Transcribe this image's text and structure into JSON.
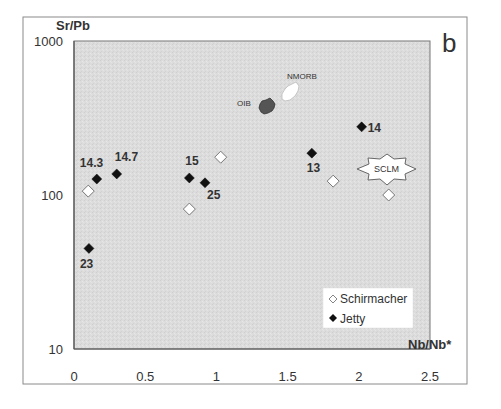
{
  "panel_label": "b",
  "chart_data": {
    "type": "scatter",
    "title": "",
    "xlabel": "Nb/Nb*",
    "ylabel": "Sr/Pb",
    "xscale": "linear",
    "yscale": "log",
    "xlim": [
      0,
      2.5
    ],
    "ylim": [
      10,
      1000
    ],
    "xticks": [
      0,
      0.5,
      1,
      1.5,
      2,
      2.5
    ],
    "xtick_labels": [
      "0",
      "0.5",
      "1",
      "1.5",
      "2",
      "2.5"
    ],
    "yticks": [
      10,
      100,
      1000
    ],
    "ytick_labels": [
      "10",
      "100",
      "1000"
    ],
    "grid": false,
    "legend_position": "lower right",
    "series": [
      {
        "name": "Schirmacher",
        "marker": "open-diamond",
        "color": "#ffffff",
        "points": [
          {
            "x": 0.1,
            "y": 106,
            "label": ""
          },
          {
            "x": 0.81,
            "y": 81,
            "label": ""
          },
          {
            "x": 1.03,
            "y": 176,
            "label": ""
          },
          {
            "x": 1.82,
            "y": 123,
            "label": ""
          },
          {
            "x": 2.21,
            "y": 100,
            "label": ""
          }
        ]
      },
      {
        "name": "Jetty",
        "marker": "filled-diamond",
        "color": "#111111",
        "points": [
          {
            "x": 0.16,
            "y": 127,
            "label": "14.3"
          },
          {
            "x": 0.3,
            "y": 137,
            "label": "14.7"
          },
          {
            "x": 0.81,
            "y": 129,
            "label": "15"
          },
          {
            "x": 0.92,
            "y": 120,
            "label": "25"
          },
          {
            "x": 0.105,
            "y": 45,
            "label": "23"
          },
          {
            "x": 1.67,
            "y": 187,
            "label": "13"
          },
          {
            "x": 2.02,
            "y": 277,
            "label": "14"
          }
        ]
      }
    ],
    "annotations": [
      {
        "text": "OIB",
        "x": 1.32,
        "y": 350,
        "shape": "dark-grey-star"
      },
      {
        "text": "NMORB",
        "x": 1.5,
        "y": 420,
        "shape": "white-star"
      },
      {
        "text": "SCLM",
        "x": 2.1,
        "y": 125,
        "shape": "white-star-outline"
      }
    ]
  },
  "legend": {
    "items": [
      {
        "label": "Schirmacher",
        "marker": "open-diamond"
      },
      {
        "label": "Jetty",
        "marker": "filled-diamond"
      }
    ]
  }
}
